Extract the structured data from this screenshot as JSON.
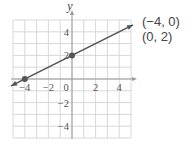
{
  "chart_data": {
    "type": "line",
    "title": "",
    "xlabel": "x",
    "ylabel": "y",
    "xlim": [
      -5,
      5
    ],
    "ylim": [
      -5,
      5
    ],
    "grid": true,
    "x_ticks": [
      -4,
      -2,
      0,
      2,
      4
    ],
    "y_ticks": [
      4,
      2,
      -2,
      -4
    ],
    "series": [
      {
        "name": "line through (-4, 0) and (0, 2)",
        "x": [
          -5,
          5
        ],
        "y": [
          -0.5,
          4.5
        ],
        "marked_points": [
          {
            "x": -4,
            "y": 0
          },
          {
            "x": 0,
            "y": 2
          }
        ]
      }
    ],
    "annotations": [
      "(−4, 0)",
      "(0, 2)"
    ]
  },
  "labels": {
    "point1": "(−4, 0)",
    "point2": "(0, 2)",
    "x_axis": "x",
    "y_axis": "y"
  },
  "colors": {
    "grid": "#d8d8d8",
    "axis": "#9a9a9a",
    "line": "#555555",
    "point": "#555555"
  }
}
